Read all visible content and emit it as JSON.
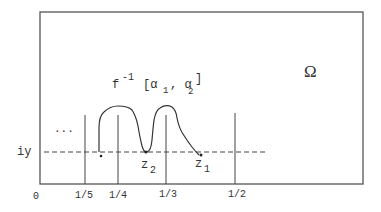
{
  "diagram": {
    "region_label": "Ω",
    "curve_label": {
      "base": "f",
      "exponent": "-1",
      "open": "[α",
      "sub1": "1",
      "comma": ", α",
      "sub2": "2",
      "close": "]"
    },
    "horizontal_line_label": "iy",
    "ellipsis": "...",
    "points": [
      {
        "base": "z",
        "sub": "2"
      },
      {
        "base": "z",
        "sub": "1"
      }
    ],
    "axis_ticks": [
      "0",
      "1/5",
      "1/4",
      "1/3",
      "1/2"
    ],
    "colors": {
      "line": "#444444",
      "background": "#ffffff"
    }
  }
}
